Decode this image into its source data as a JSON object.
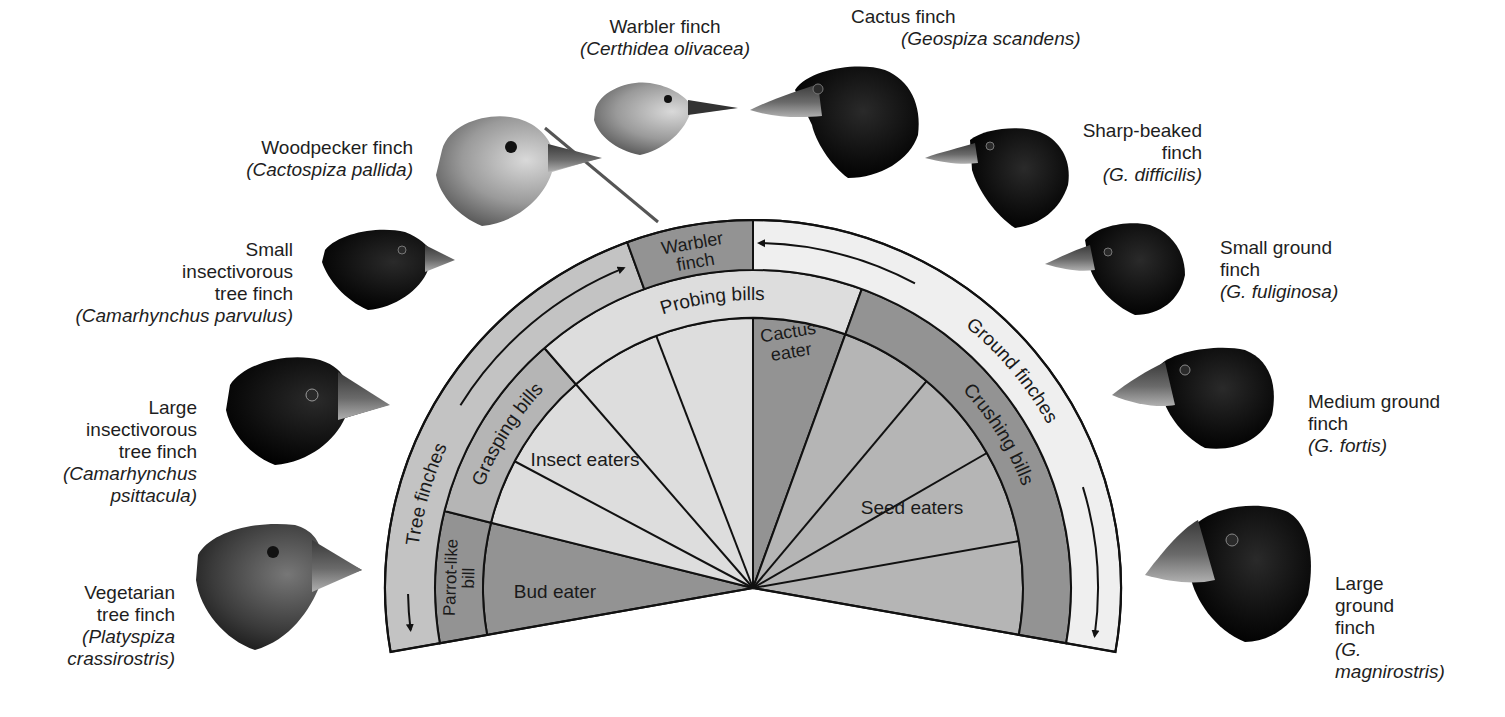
{
  "diagram": {
    "center": [
      753,
      588
    ],
    "radii": {
      "inner": 270,
      "middle": 318,
      "outer": 368
    },
    "span_deg": [
      -10,
      190
    ],
    "colors": {
      "dark": "#939393",
      "medium": "#b5b5b5",
      "light": "#dddddd",
      "tree_ring": "#c3c3c3",
      "ground_ring": "#efefef",
      "stroke": "#111111"
    },
    "outer_ring": [
      {
        "id": "tree-finches",
        "label": "Tree finches",
        "from": 110,
        "to": 190,
        "fill": "tree_ring",
        "text_arc": true,
        "arrow": "down-left"
      },
      {
        "id": "warbler-finch",
        "label_lines": [
          "Warbler",
          "finch"
        ],
        "from": 90,
        "to": 110,
        "fill": "dark"
      },
      {
        "id": "ground-finches",
        "label": "Ground finches",
        "from": -10,
        "to": 90,
        "fill": "ground_ring",
        "text_arc": true,
        "arrow": "down-right"
      }
    ],
    "middle_ring": [
      {
        "id": "parrot-like-bill",
        "label_lines": [
          "Parrot-like",
          "bill"
        ],
        "from": 166,
        "to": 190,
        "fill": "dark"
      },
      {
        "id": "grasping-bills",
        "label": "Grasping bills",
        "from": 131,
        "to": 166,
        "fill": "medium"
      },
      {
        "id": "probing-bills",
        "label": "Probing bills",
        "from": 70,
        "to": 131,
        "fill": "light"
      },
      {
        "id": "crushing-bills",
        "label": "Crushing bills",
        "from": -10,
        "to": 70,
        "fill": "dark"
      }
    ],
    "inner_wedges": [
      {
        "id": "bud-eater",
        "label": "Bud eater",
        "from": 166,
        "to": 190,
        "fill": "dark"
      },
      {
        "id": "insect-eaters",
        "label": "Insect eaters",
        "from": 90,
        "to": 166,
        "fill": "light",
        "dividers": [
          111,
          131,
          152
        ]
      },
      {
        "id": "cactus-eater",
        "label_lines": [
          "Cactus",
          "eater"
        ],
        "from": 70,
        "to": 90,
        "fill": "dark"
      },
      {
        "id": "seed-eaters",
        "label": "Seed eaters",
        "from": -10,
        "to": 70,
        "fill": "medium",
        "dividers": [
          10,
          30,
          50
        ]
      }
    ]
  },
  "finches": [
    {
      "id": "warbler",
      "common": "Warbler finch",
      "sci": "(Certhidea olivacea)"
    },
    {
      "id": "cactus",
      "common": "Cactus finch",
      "sci": "(Geospiza scandens)"
    },
    {
      "id": "woodpecker",
      "common": "Woodpecker finch",
      "sci": "(Cactospiza pallida)"
    },
    {
      "id": "sharp-beaked",
      "common": "Sharp-beaked\nfinch",
      "sci": "(G. difficilis)"
    },
    {
      "id": "small-insectivorous",
      "common": "Small\ninsectivorous\ntree finch",
      "sci": "(Camarhynchus parvulus)"
    },
    {
      "id": "small-ground",
      "common": "Small ground\nfinch",
      "sci": "(G. fuliginosa)"
    },
    {
      "id": "large-insectivorous",
      "common": "Large\ninsectivorous\ntree finch",
      "sci": "(Camarhynchus\npsittacula)"
    },
    {
      "id": "medium-ground",
      "common": "Medium ground\nfinch",
      "sci": "(G. fortis)"
    },
    {
      "id": "vegetarian",
      "common": "Vegetarian\ntree finch",
      "sci": "(Platyspiza\ncrassirostris)"
    },
    {
      "id": "large-ground",
      "common": "Large\nground\nfinch",
      "sci": "(G.\nmagnirostris)"
    }
  ]
}
